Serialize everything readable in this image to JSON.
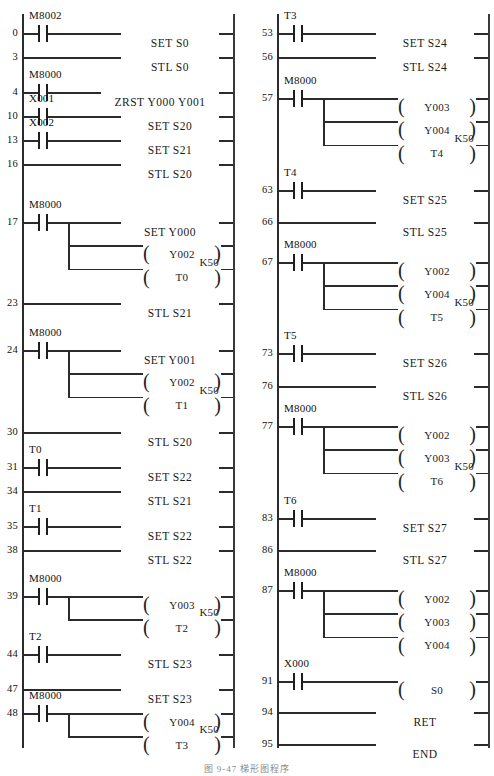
{
  "figure": {
    "caption": "图 9-47  梯形图程序"
  },
  "layout": {
    "columns": [
      {
        "left_rail_x": 22,
        "right_rail_x": 233,
        "num_right_x": 18,
        "top": 14,
        "bottom": 748
      },
      {
        "left_rail_x": 277,
        "right_rail_x": 488,
        "num_right_x": 273,
        "top": 14,
        "bottom": 748
      }
    ],
    "row_height": 23.4
  },
  "colors": {
    "line": "#2b2b2b",
    "text": "#111111",
    "background": "#ffffff"
  },
  "left_column": {
    "rungs": [
      {
        "step": "0",
        "y": 33,
        "contact": "M8002",
        "outputs": [
          {
            "kind": "instr",
            "text": "SET S0"
          }
        ]
      },
      {
        "step": "3",
        "y": 57,
        "contact": null,
        "outputs": [
          {
            "kind": "instr",
            "text": "STL S0"
          }
        ]
      },
      {
        "step": "4",
        "y": 92,
        "contact": "M8000",
        "outputs": [
          {
            "kind": "instr",
            "text": "ZRST Y000 Y001",
            "wide": true
          }
        ]
      },
      {
        "step": "10",
        "y": 116,
        "contact": "X001",
        "outputs": [
          {
            "kind": "instr",
            "text": "SET S20"
          }
        ]
      },
      {
        "step": "13",
        "y": 140,
        "contact": "X002",
        "outputs": [
          {
            "kind": "instr",
            "text": "SET S21"
          }
        ]
      },
      {
        "step": "16",
        "y": 164,
        "contact": null,
        "outputs": [
          {
            "kind": "instr",
            "text": "STL S20"
          }
        ]
      },
      {
        "step": "17",
        "y": 222,
        "contact": "M8000",
        "outputs": [
          {
            "kind": "instr",
            "text": "SET Y000"
          },
          {
            "kind": "coil",
            "text": "Y002"
          },
          {
            "kind": "coil",
            "text": "T0",
            "k": "K50"
          }
        ]
      },
      {
        "step": "23",
        "y": 303,
        "contact": null,
        "outputs": [
          {
            "kind": "instr",
            "text": "STL S21"
          }
        ]
      },
      {
        "step": "24",
        "y": 350,
        "contact": "M8000",
        "outputs": [
          {
            "kind": "instr",
            "text": "SET Y001"
          },
          {
            "kind": "coil",
            "text": "Y002"
          },
          {
            "kind": "coil",
            "text": "T1",
            "k": "K50"
          }
        ]
      },
      {
        "step": "30",
        "y": 432,
        "contact": null,
        "outputs": [
          {
            "kind": "instr",
            "text": "STL S20"
          }
        ]
      },
      {
        "step": "31",
        "y": 467,
        "contact": "T0",
        "outputs": [
          {
            "kind": "instr",
            "text": "SET S22"
          }
        ]
      },
      {
        "step": "34",
        "y": 491,
        "contact": null,
        "outputs": [
          {
            "kind": "instr",
            "text": "STL S21"
          }
        ]
      },
      {
        "step": "35",
        "y": 526,
        "contact": "T1",
        "outputs": [
          {
            "kind": "instr",
            "text": "SET S22"
          }
        ]
      },
      {
        "step": "38",
        "y": 550,
        "contact": null,
        "outputs": [
          {
            "kind": "instr",
            "text": "STL S22"
          }
        ]
      },
      {
        "step": "39",
        "y": 596,
        "contact": "M8000",
        "outputs": [
          {
            "kind": "coil",
            "text": "Y003"
          },
          {
            "kind": "coil",
            "text": "T2",
            "k": "K50"
          }
        ]
      },
      {
        "step": "44",
        "y": 654,
        "contact": "T2",
        "outputs": [
          {
            "kind": "instr",
            "text": "STL S23"
          }
        ]
      },
      {
        "step": "47",
        "y": 689,
        "contact": null,
        "outputs": [
          {
            "kind": "instr",
            "text": "SET S23"
          }
        ]
      },
      {
        "step": "48",
        "y": 713,
        "contact": "M8000",
        "outputs": [
          {
            "kind": "coil",
            "text": "Y004"
          },
          {
            "kind": "coil",
            "text": "T3",
            "k": "K50"
          }
        ]
      }
    ]
  },
  "right_column": {
    "rungs": [
      {
        "step": "53",
        "y": 33,
        "contact": "T3",
        "outputs": [
          {
            "kind": "instr",
            "text": "SET S24"
          }
        ]
      },
      {
        "step": "56",
        "y": 57,
        "contact": null,
        "outputs": [
          {
            "kind": "instr",
            "text": "STL S24"
          }
        ]
      },
      {
        "step": "57",
        "y": 98,
        "contact": "M8000",
        "outputs": [
          {
            "kind": "coil",
            "text": "Y003"
          },
          {
            "kind": "coil",
            "text": "Y004"
          },
          {
            "kind": "coil",
            "text": "T4",
            "k": "K50"
          }
        ]
      },
      {
        "step": "63",
        "y": 190,
        "contact": "T4",
        "outputs": [
          {
            "kind": "instr",
            "text": "SET S25"
          }
        ]
      },
      {
        "step": "66",
        "y": 222,
        "contact": null,
        "outputs": [
          {
            "kind": "instr",
            "text": "STL S25"
          }
        ]
      },
      {
        "step": "67",
        "y": 262,
        "contact": "M8000",
        "outputs": [
          {
            "kind": "coil",
            "text": "Y002"
          },
          {
            "kind": "coil",
            "text": "Y004"
          },
          {
            "kind": "coil",
            "text": "T5",
            "k": "K50"
          }
        ]
      },
      {
        "step": "73",
        "y": 353,
        "contact": "T5",
        "outputs": [
          {
            "kind": "instr",
            "text": "SET S26"
          }
        ]
      },
      {
        "step": "76",
        "y": 386,
        "contact": null,
        "outputs": [
          {
            "kind": "instr",
            "text": "STL S26"
          }
        ]
      },
      {
        "step": "77",
        "y": 426,
        "contact": "M8000",
        "outputs": [
          {
            "kind": "coil",
            "text": "Y002"
          },
          {
            "kind": "coil",
            "text": "Y003"
          },
          {
            "kind": "coil",
            "text": "T6",
            "k": "K50"
          }
        ]
      },
      {
        "step": "83",
        "y": 518,
        "contact": "T6",
        "outputs": [
          {
            "kind": "instr",
            "text": "SET S27"
          }
        ]
      },
      {
        "step": "86",
        "y": 550,
        "contact": null,
        "outputs": [
          {
            "kind": "instr",
            "text": "STL S27"
          }
        ]
      },
      {
        "step": "87",
        "y": 590,
        "contact": "M8000",
        "outputs": [
          {
            "kind": "coil",
            "text": "Y002"
          },
          {
            "kind": "coil",
            "text": "Y003"
          },
          {
            "kind": "coil",
            "text": "Y004"
          }
        ]
      },
      {
        "step": "91",
        "y": 681,
        "contact": "X000",
        "outputs": [
          {
            "kind": "coil",
            "text": "S0"
          }
        ]
      },
      {
        "step": "94",
        "y": 712,
        "contact": null,
        "outputs": [
          {
            "kind": "instr",
            "text": "RET"
          }
        ]
      },
      {
        "step": "95",
        "y": 744,
        "contact": null,
        "outputs": [
          {
            "kind": "instr",
            "text": "END"
          }
        ]
      }
    ]
  }
}
